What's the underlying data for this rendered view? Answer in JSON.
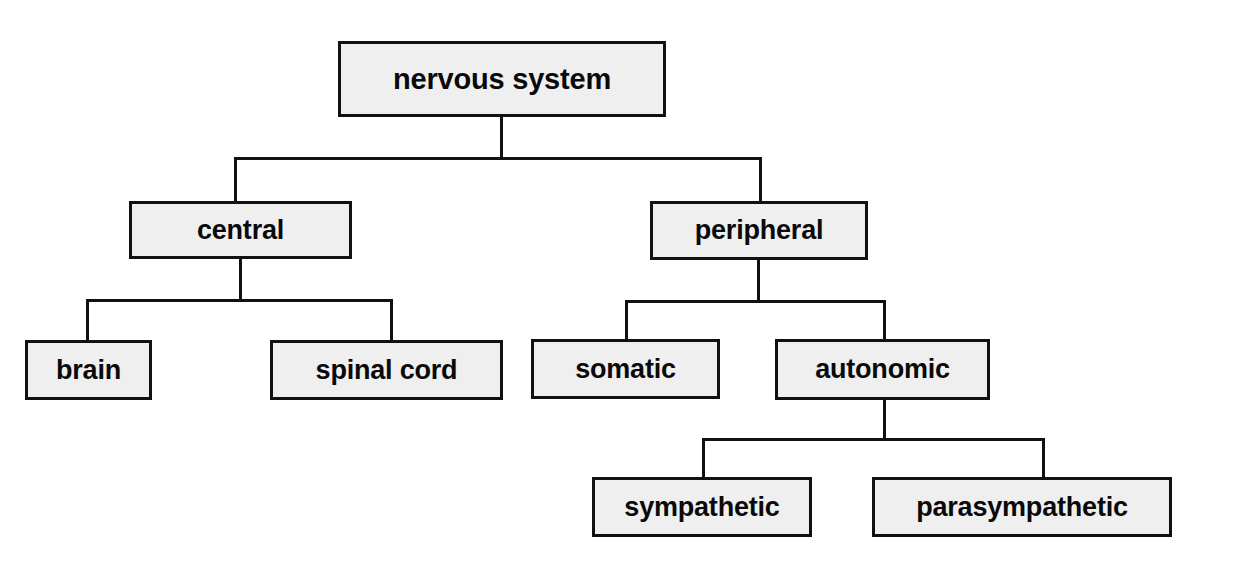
{
  "diagram": {
    "type": "hierarchy-tree",
    "title": "nervous system",
    "orientation": "top-down",
    "colors": {
      "background": "#ffffff",
      "node_fill": "#efefef",
      "node_border": "#111111",
      "connector": "#111111",
      "text": "#0a0a0a"
    },
    "nodes": {
      "root": {
        "label": "nervous system",
        "level": 0
      },
      "central": {
        "label": "central",
        "level": 1
      },
      "peripheral": {
        "label": "peripheral",
        "level": 1
      },
      "brain": {
        "label": "brain",
        "level": 2
      },
      "spinal_cord": {
        "label": "spinal cord",
        "level": 2
      },
      "somatic": {
        "label": "somatic",
        "level": 2
      },
      "autonomic": {
        "label": "autonomic",
        "level": 2
      },
      "sympathetic": {
        "label": "sympathetic",
        "level": 3
      },
      "parasympathetic": {
        "label": "parasympathetic",
        "level": 3
      }
    },
    "edges": [
      {
        "from": "root",
        "to": "central"
      },
      {
        "from": "root",
        "to": "peripheral"
      },
      {
        "from": "central",
        "to": "brain"
      },
      {
        "from": "central",
        "to": "spinal_cord"
      },
      {
        "from": "peripheral",
        "to": "somatic"
      },
      {
        "from": "peripheral",
        "to": "autonomic"
      },
      {
        "from": "autonomic",
        "to": "sympathetic"
      },
      {
        "from": "autonomic",
        "to": "parasympathetic"
      }
    ]
  }
}
